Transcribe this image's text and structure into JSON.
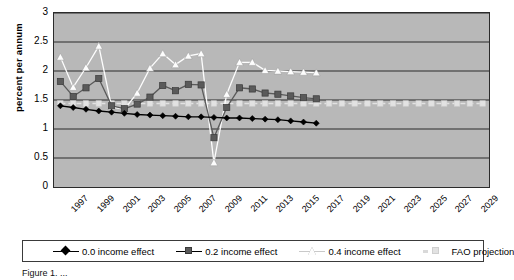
{
  "chart_data": {
    "type": "line",
    "title": "",
    "xlabel": "",
    "ylabel": "percent per annum",
    "ylim": [
      0,
      3
    ],
    "ytick_values": [
      0,
      0.5,
      1,
      1.5,
      2,
      2.5,
      3
    ],
    "ytick_labels": [
      "0",
      "0.5",
      "1",
      "1.5",
      "2",
      "2.5",
      "3"
    ],
    "xlim": [
      1996.5,
      2030.5
    ],
    "x": [
      1997,
      1998,
      1999,
      2000,
      2001,
      2002,
      2003,
      2004,
      2005,
      2006,
      2007,
      2008,
      2009,
      2010,
      2011,
      2012,
      2013,
      2014,
      2015,
      2016,
      2017,
      2018,
      2019,
      2020,
      2021,
      2022,
      2023,
      2024,
      2025,
      2026,
      2027,
      2028,
      2029,
      2030
    ],
    "xtick_labels": [
      "1997",
      "1999",
      "2001",
      "2003",
      "2005",
      "2007",
      "2009",
      "2011",
      "2013",
      "2015",
      "2017",
      "2019",
      "2021",
      "2023",
      "2025",
      "2027",
      "2029"
    ],
    "xtick_values": [
      1997,
      1999,
      2001,
      2003,
      2005,
      2007,
      2009,
      2011,
      2013,
      2015,
      2017,
      2019,
      2021,
      2023,
      2025,
      2027,
      2029
    ],
    "grid": "horizontal",
    "legend_position": "bottom",
    "plot_background": "#b8b8b8",
    "series": [
      {
        "name": "0.0 income effect",
        "color": "#000000",
        "marker": "diamond",
        "values": [
          1.4,
          1.37,
          1.34,
          1.31,
          1.29,
          1.27,
          1.25,
          1.24,
          1.23,
          1.22,
          1.21,
          1.21,
          1.2,
          1.19,
          1.19,
          1.18,
          1.17,
          1.16,
          1.14,
          1.12,
          1.1,
          null,
          null,
          null,
          null,
          null,
          null,
          null,
          null,
          null,
          null,
          null,
          null,
          null
        ]
      },
      {
        "name": "0.2 income effect",
        "color": "#5a5a5a",
        "marker": "square",
        "values": [
          1.82,
          1.56,
          1.71,
          1.87,
          1.4,
          1.35,
          1.43,
          1.55,
          1.75,
          1.66,
          1.77,
          1.76,
          0.85,
          1.37,
          1.71,
          1.69,
          1.62,
          1.6,
          1.57,
          1.54,
          1.52,
          null,
          null,
          null,
          null,
          null,
          null,
          null,
          null,
          null,
          null,
          null,
          null,
          null
        ]
      },
      {
        "name": "0.4 income effect",
        "color": "#fdfdfd",
        "marker": "triangle",
        "values": [
          2.24,
          1.72,
          2.06,
          2.43,
          1.38,
          1.34,
          1.62,
          2.05,
          2.3,
          2.11,
          2.26,
          2.3,
          0.42,
          1.6,
          2.15,
          2.15,
          2.01,
          2.0,
          1.99,
          1.98,
          1.97,
          null,
          null,
          null,
          null,
          null,
          null,
          null,
          null,
          null,
          null,
          null,
          null,
          null
        ]
      },
      {
        "name": "FAO projection",
        "color": "#e2e2e2",
        "marker": "square-light",
        "style": "dashed",
        "values": [
          1.44,
          1.44,
          1.44,
          1.44,
          1.44,
          1.44,
          1.44,
          1.44,
          1.44,
          1.44,
          1.44,
          1.44,
          1.44,
          1.44,
          1.44,
          1.44,
          1.44,
          1.44,
          1.44,
          1.44,
          1.44,
          1.44,
          1.44,
          1.44,
          1.44,
          1.44,
          1.44,
          1.44,
          1.44,
          1.44,
          1.44,
          1.44,
          1.44,
          1.44
        ]
      }
    ]
  },
  "legend": {
    "items": [
      {
        "label": "0.0 income effect",
        "marker": "diamond-icon"
      },
      {
        "label": "0.2 income effect",
        "marker": "square-icon"
      },
      {
        "label": "0.4 income effect",
        "marker": "triangle-icon"
      },
      {
        "label": "FAO projection",
        "marker": "dashed-square-icon"
      }
    ]
  },
  "caption": {
    "text": "Figure 1. ..."
  }
}
